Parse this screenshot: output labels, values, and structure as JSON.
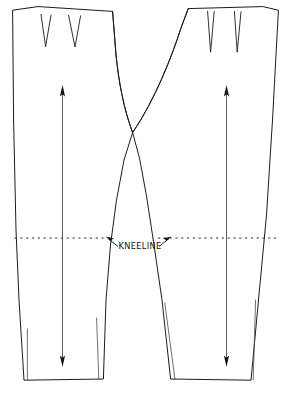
{
  "diagram": {
    "background_color": "#ffffff",
    "ink_color": "#1b1b1b",
    "annotations": {
      "kneeline_label": "KNEELINE"
    },
    "icons": {
      "grain_arrow_up": "arrow-up-icon",
      "grain_arrow_down": "arrow-down-icon",
      "pointer_left": "arrow-pointer-left-icon",
      "pointer_right": "arrow-pointer-right-icon"
    },
    "pieces": [
      {
        "name": "front-left-leg-piece",
        "label": "",
        "dart_count": 2,
        "has_grainline": true,
        "has_hem_fold": true
      },
      {
        "name": "front-right-leg-piece",
        "label": "",
        "dart_count": 2,
        "has_grainline": true,
        "has_hem_fold": true
      }
    ],
    "geometry": {
      "left_piece_outline": "M 12.5,10.5 L 38.5,6.5 L 112.5,11.5 L 117.5,60 C 121,88 126,112 132.5,132.5 L 120.5,186 L 110.5,280 L 104.5,378.5 L 23.5,379.5 L 14.5,236 Z",
      "right_piece_outline": "M 278.5,10.5 L 262.5,6.5 L 188.5,8.5 L 176.5,32 C 163,66 148,105 132.5,132.5 L 144,176 L 156.5,250 L 170.5,378.5 L 251.5,379.5 L 273.5,236 Z",
      "kneeline_y": 238,
      "kneeline_x_start": 12,
      "kneeline_x_end": 281,
      "left_darts": [
        {
          "left": 41.0,
          "tip_x": 45.5,
          "right": 51.0,
          "top_y": 14.5,
          "tip_y": 46.5
        },
        {
          "left": 68.5,
          "tip_x": 75.0,
          "right": 80.5,
          "top_y": 15.5,
          "tip_y": 47.0
        }
      ],
      "right_darts": [
        {
          "left": 208.0,
          "tip_x": 210.5,
          "right": 214.0,
          "top_y": 11.0,
          "tip_y": 52.0
        },
        {
          "left": 234.5,
          "tip_x": 237.0,
          "right": 241.0,
          "top_y": 11.5,
          "tip_y": 52.0
        }
      ],
      "left_grainline": {
        "x_top": 62.5,
        "y_top": 88,
        "x_bottom": 62.5,
        "y_bottom": 364
      },
      "right_grainline": {
        "x_top": 226.5,
        "y_top": 88,
        "x_bottom": 226.5,
        "y_bottom": 364
      }
    }
  }
}
